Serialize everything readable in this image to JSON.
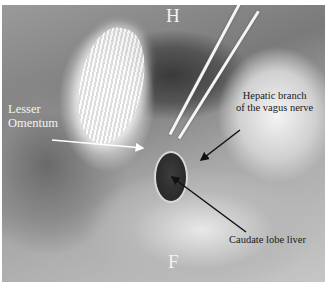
{
  "figure": {
    "type": "intraoperative grayscale photograph",
    "orientation_labels": {
      "top": "H",
      "bottom": "F"
    },
    "annotations": [
      {
        "id": "lesser_omentum",
        "text_lines": [
          "Lesser",
          "Omentum"
        ],
        "arrow_color": "#ffffff"
      },
      {
        "id": "hepatic_branch",
        "text_lines": [
          "Hepatic branch",
          "of the vagus nerve"
        ],
        "arrow_color": "#111111"
      },
      {
        "id": "caudate_lobe",
        "text_lines": [
          "Caudate lobe liver"
        ],
        "arrow_color": "#111111"
      }
    ]
  }
}
